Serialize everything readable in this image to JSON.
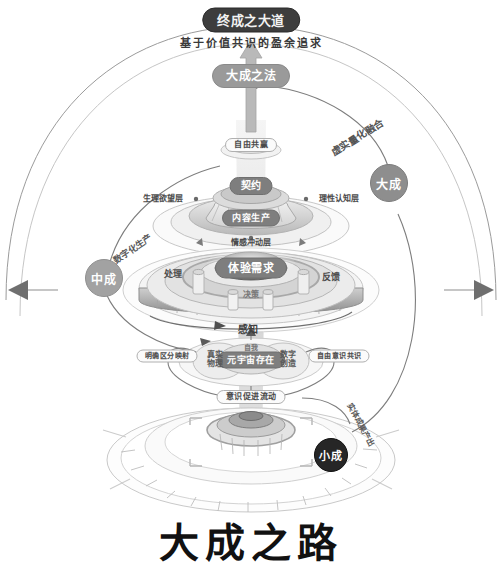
{
  "poster": {
    "title": "大成之路",
    "subtitle_top": "基于价值共识的盈余追求"
  },
  "top_nodes": {
    "apex_label": "终成之大道",
    "method_label": "大成之法"
  },
  "milestone_nodes": [
    {
      "id": "da-cheng",
      "label": "大成"
    },
    {
      "id": "zhong-cheng",
      "label": "中成"
    },
    {
      "id": "xiao-cheng",
      "label": "小成"
    }
  ],
  "connector_labels": [
    {
      "id": "fusion",
      "label": "虚实量化融合"
    },
    {
      "id": "digital-production",
      "label": "数字化生产"
    },
    {
      "id": "entity-output",
      "label": "实体成果产出"
    },
    {
      "id": "free-win",
      "label": "自由共赢"
    },
    {
      "id": "consciousness-flow",
      "label": "意识促进流动"
    }
  ],
  "tiers": {
    "top_tier": {
      "core_label": "契约",
      "secondary_label": "内容生产",
      "left_axis_label": "生理欲望层",
      "right_axis_label": "理性认知层",
      "bottom_axis_label": "情感冲动层"
    },
    "middle_tier": {
      "core_label": "体验需求",
      "decision_label": "决策",
      "perception_label": "感知",
      "process_label": "处理",
      "feedback_label": "反馈",
      "gate_label": "自我"
    },
    "base_tier": {
      "center_label": "元宇宙存在",
      "left_label": "真实\n物理",
      "right_label": "数字\n创造",
      "left_outer_label": "明确区分映射",
      "right_outer_label": "自由意识共识"
    }
  },
  "colors": {
    "ink": "#111111",
    "dark_chip": "#3d3d3d",
    "grey_chip": "#9a9a9a",
    "line": "#8d8d8d",
    "ring_light": "#e8e8e8",
    "ring_mid": "#bdbdbd",
    "ring_dark": "#7b7b7b"
  }
}
